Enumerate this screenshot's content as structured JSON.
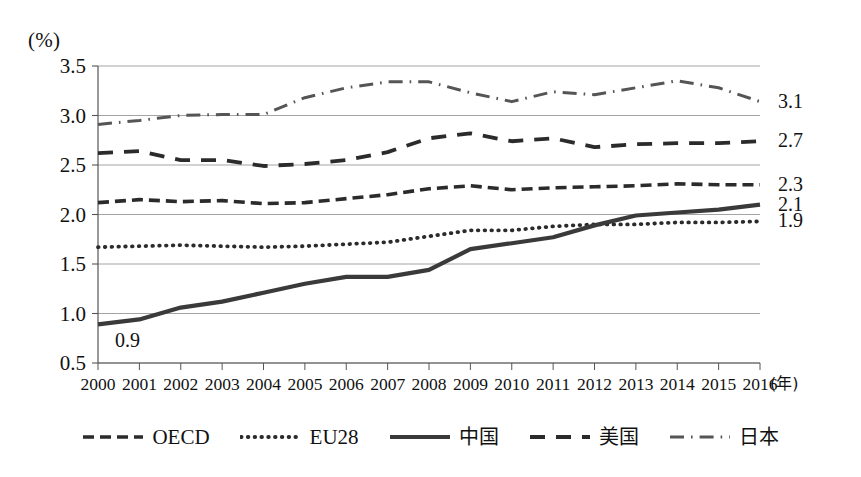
{
  "chart_data": {
    "type": "line",
    "title": "",
    "subtitle": "",
    "xlabel": "(年)",
    "ylabel": "(%)",
    "x": [
      2000,
      2001,
      2002,
      2003,
      2004,
      2005,
      2006,
      2007,
      2008,
      2009,
      2010,
      2011,
      2012,
      2013,
      2014,
      2015,
      2016
    ],
    "categories": [
      "2000",
      "2001",
      "2002",
      "2003",
      "2004",
      "2005",
      "2006",
      "2007",
      "2008",
      "2009",
      "2010",
      "2011",
      "2012",
      "2013",
      "2014",
      "2015",
      "2016"
    ],
    "xlim": [
      2000,
      2016
    ],
    "ylim": [
      0.5,
      3.5
    ],
    "yticks": [
      "0.5",
      "1.0",
      "1.5",
      "2.0",
      "2.5",
      "3.0",
      "3.5"
    ],
    "ytick_values": [
      0.5,
      1.0,
      1.5,
      2.0,
      2.5,
      3.0,
      3.5
    ],
    "grid": true,
    "legend_position": "bottom",
    "series": [
      {
        "name": "OECD",
        "style": "dashed",
        "color": "#2b2b2b",
        "values": [
          2.12,
          2.15,
          2.13,
          2.14,
          2.11,
          2.12,
          2.16,
          2.2,
          2.26,
          2.29,
          2.25,
          2.27,
          2.28,
          2.29,
          2.31,
          2.3,
          2.3
        ],
        "end_label": "2.3"
      },
      {
        "name": "EU28",
        "style": "dotted",
        "color": "#2b2b2b",
        "values": [
          1.67,
          1.68,
          1.69,
          1.68,
          1.67,
          1.68,
          1.7,
          1.72,
          1.78,
          1.84,
          1.84,
          1.88,
          1.9,
          1.9,
          1.92,
          1.92,
          1.93
        ],
        "end_label": "1.9"
      },
      {
        "name": "中国",
        "style": "solid",
        "color": "#3a3a3a",
        "values": [
          0.89,
          0.94,
          1.06,
          1.12,
          1.21,
          1.3,
          1.37,
          1.37,
          1.44,
          1.65,
          1.71,
          1.77,
          1.89,
          1.99,
          2.02,
          2.05,
          2.1
        ],
        "end_label": "2.1",
        "start_label": "0.9"
      },
      {
        "name": "美国",
        "style": "dashed-long",
        "color": "#2b2b2b",
        "values": [
          2.62,
          2.64,
          2.55,
          2.55,
          2.49,
          2.51,
          2.55,
          2.63,
          2.77,
          2.82,
          2.74,
          2.77,
          2.68,
          2.71,
          2.72,
          2.72,
          2.74
        ],
        "end_label": "2.7"
      },
      {
        "name": "日本",
        "style": "dash-dot",
        "color": "#555555",
        "values": [
          2.91,
          2.95,
          3.0,
          3.01,
          3.01,
          3.18,
          3.28,
          3.34,
          3.34,
          3.23,
          3.14,
          3.24,
          3.21,
          3.28,
          3.35,
          3.28,
          3.14
        ],
        "end_label": "3.1"
      }
    ]
  },
  "legend": {
    "items": [
      {
        "label": "OECD",
        "style": "dashed",
        "cjk": false
      },
      {
        "label": "EU28",
        "style": "dotted",
        "cjk": false
      },
      {
        "label": "中国",
        "style": "solid",
        "cjk": true
      },
      {
        "label": "美国",
        "style": "dashed-long",
        "cjk": true
      },
      {
        "label": "日本",
        "style": "dash-dot",
        "cjk": true
      }
    ]
  },
  "axes": {
    "y_unit": "(%)",
    "x_unit": "(年)"
  }
}
